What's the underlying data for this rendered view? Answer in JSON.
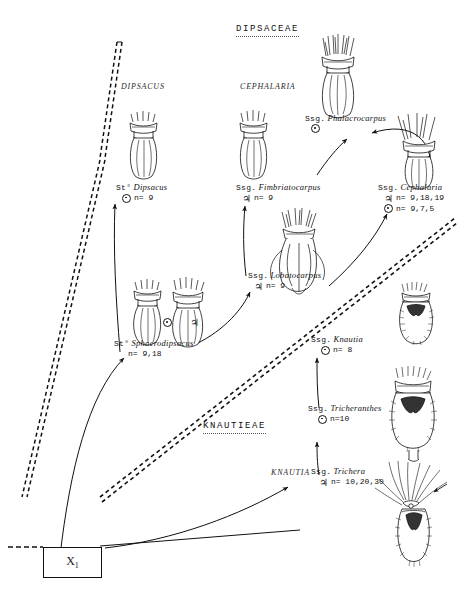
{
  "figure": {
    "family_heading": "DIPSACEAE",
    "tribe_heading": "KNAUTIEAE",
    "ancestor_label": "X",
    "ancestor_sub": "1"
  },
  "genera": [
    {
      "name": "DIPSACUS"
    },
    {
      "name": "CEPHALARIA"
    },
    {
      "name": "KNAUTIA"
    }
  ],
  "taxa": [
    {
      "rank": "St°",
      "name": "Dipsacus",
      "counts": [
        {
          "symbol": "annual-symbol",
          "n": "n= 9"
        }
      ]
    },
    {
      "rank": "St°",
      "name": "Sphaerodipsacus",
      "counts": [
        {
          "symbol": "none",
          "n": "n= 9,18"
        }
      ]
    },
    {
      "rank": "Ssg.",
      "name": "Fimbriatocarpus",
      "counts": [
        {
          "symbol": "perennial-symbol",
          "n": "n= 9"
        }
      ]
    },
    {
      "rank": "Ssg.",
      "name": "Lobatocarpus",
      "counts": [
        {
          "symbol": "perennial-symbol",
          "n": "n= 9"
        }
      ]
    },
    {
      "rank": "Ssg.",
      "name": "Phalacrocarpus",
      "counts": [
        {
          "symbol": "annual-symbol",
          "n": ""
        }
      ]
    },
    {
      "rank": "Ssg.",
      "name": "Cephalaria",
      "counts": [
        {
          "symbol": "perennial-symbol",
          "n": "n= 9,18,19"
        },
        {
          "symbol": "annual-symbol",
          "n": "n= 9,7,5"
        }
      ]
    },
    {
      "rank": "Ssg.",
      "name": "Knautia",
      "counts": [
        {
          "symbol": "annual-symbol",
          "n": "n= 8"
        }
      ]
    },
    {
      "rank": "Ssg.",
      "name": "Tricheranthes",
      "counts": [
        {
          "symbol": "annual-symbol",
          "n": "n=10"
        }
      ]
    },
    {
      "rank": "Ssg.",
      "name": "Trichera",
      "counts": [
        {
          "symbol": "perennial-symbol",
          "n": "n= 10,20,30"
        }
      ]
    }
  ],
  "symbols": {
    "annual_glyph": "⊙",
    "perennial_glyph": "♃"
  },
  "colors": {
    "ink": "#111111",
    "paper": "#ffffff"
  }
}
